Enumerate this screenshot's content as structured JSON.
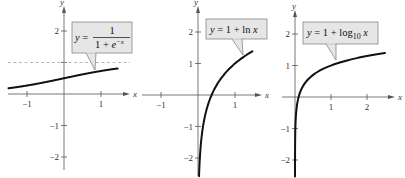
{
  "chart_data": [
    {
      "type": "line",
      "title": "",
      "function": "y = 1/(1 + e^-x)",
      "label": {
        "lhs": "y =",
        "numerator": "1",
        "denominator_prefix": "1 + e",
        "exponent": "−x"
      },
      "xlabel": "x",
      "ylabel": "y",
      "xlim": [
        -1.5,
        1.6
      ],
      "ylim": [
        -2.5,
        2.6
      ],
      "x_ticks": [
        -1,
        1
      ],
      "x_tick_labels": [
        "−1",
        "1"
      ],
      "y_ticks": [
        -2,
        -1,
        1,
        2
      ],
      "y_tick_labels": [
        "−2",
        "−1",
        "",
        "2"
      ],
      "asymptote": {
        "y": 1,
        "style": "dashed"
      },
      "points": [
        [
          -1.5,
          0.18
        ],
        [
          -1,
          0.27
        ],
        [
          -0.5,
          0.38
        ],
        [
          0,
          0.5
        ],
        [
          0.5,
          0.62
        ],
        [
          1,
          0.73
        ],
        [
          1.5,
          0.82
        ]
      ]
    },
    {
      "type": "line",
      "title": "",
      "function": "y = 1 + ln x",
      "label": {
        "text_pre": "y = 1 + ln ",
        "text_var": "x"
      },
      "xlabel": "x",
      "ylabel": "y",
      "xlim": [
        -1.5,
        1.6
      ],
      "ylim": [
        -2.5,
        2.6
      ],
      "x_ticks": [
        -1,
        1
      ],
      "x_tick_labels": [
        "−1",
        "1"
      ],
      "y_ticks": [
        -2,
        -1,
        1,
        2
      ],
      "y_tick_labels": [
        "−2",
        "−1",
        "1",
        "2"
      ],
      "points": [
        [
          0.03,
          -2.5
        ],
        [
          0.05,
          -2.0
        ],
        [
          0.1,
          -1.3
        ],
        [
          0.2,
          -0.61
        ],
        [
          0.37,
          0
        ],
        [
          0.5,
          0.31
        ],
        [
          0.75,
          0.71
        ],
        [
          1,
          1
        ],
        [
          1.25,
          1.22
        ],
        [
          1.5,
          1.41
        ]
      ]
    },
    {
      "type": "line",
      "title": "",
      "function": "y = 1 + log10 x",
      "label": {
        "text_pre": "y = 1 + log",
        "subscript": "10",
        "text_var": "x"
      },
      "xlabel": "x",
      "ylabel": "y",
      "xlim": [
        -0.5,
        2.6
      ],
      "ylim": [
        -2.5,
        2.6
      ],
      "x_ticks": [
        1,
        2
      ],
      "x_tick_labels": [
        "1",
        "2"
      ],
      "y_ticks": [
        -2,
        -1,
        1,
        2
      ],
      "y_tick_labels": [
        "−2",
        "−1",
        "1",
        "2"
      ],
      "points": [
        [
          0.0003,
          -2.5
        ],
        [
          0.001,
          -2.0
        ],
        [
          0.01,
          -1.0
        ],
        [
          0.05,
          -0.3
        ],
        [
          0.1,
          0
        ],
        [
          0.3,
          0.48
        ],
        [
          0.5,
          0.7
        ],
        [
          1,
          1
        ],
        [
          1.5,
          1.18
        ],
        [
          2,
          1.3
        ],
        [
          2.5,
          1.4
        ]
      ]
    }
  ]
}
